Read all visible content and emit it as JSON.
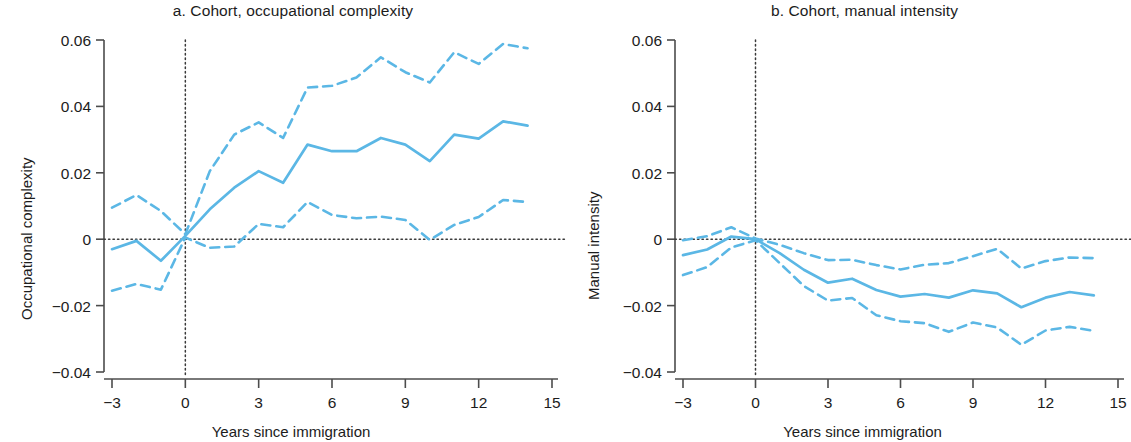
{
  "figure": {
    "background_color": "#ffffff",
    "series_color": "#5BB7E5",
    "axis_color": "#4c4c4c"
  },
  "panels": [
    {
      "id": "a",
      "title": "a. Cohort, occupational complexity",
      "xlabel": "Years since immigration",
      "ylabel": "Occupational complexity"
    },
    {
      "id": "b",
      "title": "b. Cohort, manual intensity",
      "xlabel": "Years since immigration",
      "ylabel": "Manual intensity"
    }
  ],
  "axis": {
    "y_ticks": [
      "0.06",
      "0.04",
      "0.02",
      "0",
      "−0.02",
      "−0.04"
    ],
    "y_tick_values": [
      0.06,
      0.04,
      0.02,
      0,
      -0.02,
      -0.04
    ],
    "x_ticks": [
      "−3",
      "0",
      "3",
      "6",
      "9",
      "12",
      "15"
    ],
    "x_tick_values": [
      -3,
      0,
      3,
      6,
      9,
      12,
      15
    ]
  },
  "chart_data": [
    {
      "type": "line",
      "panel": "a",
      "title": "a. Cohort, occupational complexity",
      "xlabel": "Years since immigration",
      "ylabel": "Occupational complexity",
      "xlim": [
        -3,
        15
      ],
      "ylim": [
        -0.04,
        0.06
      ],
      "grid": false,
      "legend": "none",
      "annotations": [
        {
          "type": "vline",
          "x": 0,
          "style": "dotted"
        },
        {
          "type": "hline",
          "y": 0,
          "style": "dotted"
        }
      ],
      "x": [
        -3,
        -2,
        -1,
        0,
        1,
        2,
        3,
        4,
        5,
        6,
        7,
        8,
        9,
        10,
        11,
        12,
        13,
        14
      ],
      "series": [
        {
          "name": "point estimate",
          "style": "solid",
          "values": [
            -0.003,
            -0.0005,
            -0.0065,
            0.001,
            0.009,
            0.0155,
            0.0205,
            0.017,
            0.0285,
            0.0265,
            0.0265,
            0.0305,
            0.0285,
            0.0235,
            0.0315,
            0.0303,
            0.0355,
            0.0342
          ]
        },
        {
          "name": "upper confidence bound",
          "style": "dashed",
          "values": [
            0.0095,
            0.0133,
            0.0085,
            0.0015,
            0.0205,
            0.0315,
            0.0352,
            0.0305,
            0.0457,
            0.0462,
            0.0487,
            0.0548,
            0.0503,
            0.0472,
            0.0563,
            0.0528,
            0.0588,
            0.0575
          ]
        },
        {
          "name": "lower confidence bound",
          "style": "dashed",
          "values": [
            -0.0155,
            -0.0135,
            -0.0152,
            0.0005,
            -0.0026,
            -0.0022,
            0.0046,
            0.0036,
            0.0112,
            0.0073,
            0.0063,
            0.0068,
            0.0058,
            -0.0002,
            0.0043,
            0.0067,
            0.0118,
            0.0112
          ]
        }
      ]
    },
    {
      "type": "line",
      "panel": "b",
      "title": "b. Cohort, manual intensity",
      "xlabel": "Years since immigration",
      "ylabel": "Manual intensity",
      "xlim": [
        -3,
        15
      ],
      "ylim": [
        -0.04,
        0.06
      ],
      "grid": false,
      "legend": "none",
      "annotations": [
        {
          "type": "vline",
          "x": 0,
          "style": "dotted"
        },
        {
          "type": "hline",
          "y": 0,
          "style": "dotted"
        }
      ],
      "x": [
        -3,
        -2,
        -1,
        0,
        1,
        2,
        3,
        4,
        5,
        6,
        7,
        8,
        9,
        10,
        11,
        12,
        13,
        14
      ],
      "series": [
        {
          "name": "point estimate",
          "style": "solid",
          "values": [
            -0.0048,
            -0.0031,
            0.0008,
            0.0,
            -0.0042,
            -0.0092,
            -0.0131,
            -0.0119,
            -0.0153,
            -0.0173,
            -0.0165,
            -0.0176,
            -0.0154,
            -0.0163,
            -0.0205,
            -0.0176,
            -0.0159,
            -0.0169
          ]
        },
        {
          "name": "upper confidence bound",
          "style": "dashed",
          "values": [
            -0.0003,
            0.0009,
            0.0036,
            0.0002,
            -0.0017,
            -0.0042,
            -0.0063,
            -0.0062,
            -0.0078,
            -0.0091,
            -0.0077,
            -0.0072,
            -0.0051,
            -0.0029,
            -0.0088,
            -0.0066,
            -0.0055,
            -0.0057
          ]
        },
        {
          "name": "lower confidence bound",
          "style": "dashed",
          "values": [
            -0.0108,
            -0.0084,
            -0.0025,
            -0.0003,
            -0.0072,
            -0.0141,
            -0.0185,
            -0.0177,
            -0.0229,
            -0.0247,
            -0.0253,
            -0.0279,
            -0.0251,
            -0.0266,
            -0.0318,
            -0.0275,
            -0.0264,
            -0.0276
          ]
        }
      ]
    }
  ]
}
